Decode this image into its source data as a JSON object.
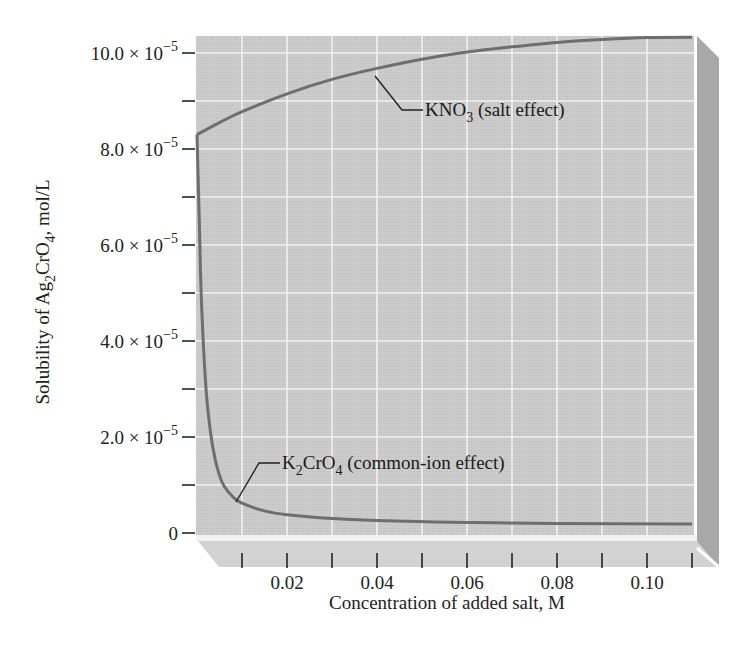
{
  "chart_data": {
    "type": "line",
    "title": "",
    "xlabel": "Concentration of added salt, M",
    "ylabel": "Solubility of Ag2CrO4, mol/L",
    "ylabel_parts": {
      "pre": "Solubility of Ag",
      "sub1": "2",
      "mid": "CrO",
      "sub2": "4",
      "post": ", mol/L"
    },
    "xlim": [
      0,
      0.11
    ],
    "ylim": [
      0,
      0.000105
    ],
    "grid": true,
    "x_ticks": [
      0.01,
      0.02,
      0.03,
      0.04,
      0.05,
      0.06,
      0.07,
      0.08,
      0.09,
      0.1,
      0.11
    ],
    "x_tick_labels": [
      {
        "value": 0.02,
        "label": "0.02"
      },
      {
        "value": 0.04,
        "label": "0.04"
      },
      {
        "value": 0.06,
        "label": "0.06"
      },
      {
        "value": 0.08,
        "label": "0.08"
      },
      {
        "value": 0.1,
        "label": "0.10"
      }
    ],
    "y_ticks": [
      0,
      1e-05,
      2e-05,
      3e-05,
      4e-05,
      5e-05,
      6e-05,
      7e-05,
      8e-05,
      9e-05,
      0.0001
    ],
    "y_tick_labels": [
      {
        "value": 0,
        "mant": "0",
        "exp": ""
      },
      {
        "value": 2e-05,
        "mant": "2.0 × 10",
        "exp": "−5"
      },
      {
        "value": 4e-05,
        "mant": "4.0 × 10",
        "exp": "−5"
      },
      {
        "value": 6e-05,
        "mant": "6.0 × 10",
        "exp": "−5"
      },
      {
        "value": 8e-05,
        "mant": "8.0 × 10",
        "exp": "−5"
      },
      {
        "value": 0.0001,
        "mant": "10.0 × 10",
        "exp": "−5"
      }
    ],
    "series": [
      {
        "name": "KNO3 (salt effect)",
        "x": [
          0,
          0.005,
          0.01,
          0.02,
          0.03,
          0.04,
          0.05,
          0.06,
          0.07,
          0.08,
          0.09,
          0.1,
          0.11
        ],
        "values": [
          8.3e-05,
          8.55e-05,
          8.78e-05,
          9.15e-05,
          9.45e-05,
          9.68e-05,
          9.87e-05,
          0.0001002,
          0.0001013,
          0.0001022,
          0.0001028,
          0.0001032,
          0.0001033
        ]
      },
      {
        "name": "K2CrO4 (common-ion effect)",
        "x": [
          0,
          0.0005,
          0.001,
          0.002,
          0.003,
          0.004,
          0.005,
          0.006,
          0.008,
          0.01,
          0.015,
          0.02,
          0.03,
          0.04,
          0.06,
          0.08,
          0.11
        ],
        "values": [
          8.3e-05,
          6.5e-05,
          4.8e-05,
          3e-05,
          2.1e-05,
          1.55e-05,
          1.2e-05,
          9.8e-06,
          7.5e-06,
          6.2e-06,
          4.6e-06,
          3.8e-06,
          3e-06,
          2.6e-06,
          2.2e-06,
          2e-06,
          1.9e-06
        ]
      }
    ],
    "annotations": [
      {
        "text": "KNO3 (salt effect)",
        "base": "KNO",
        "sub": "3",
        "rest": " (salt effect)",
        "x_anchor": 0.037,
        "y_anchor": 9.6e-05
      },
      {
        "text": "K2CrO4 (common-ion effect)",
        "base": "K",
        "sub": "2",
        "mid": "CrO",
        "sub2": "4",
        "rest": " (common-ion effect)",
        "x_anchor": 0.008,
        "y_anchor": 7.5e-06
      }
    ],
    "colors": {
      "plot_background": "#c8c8c8",
      "grid": "#f2f2f2",
      "curve": "#6e6e6e",
      "side_face": "#a9a9a9",
      "bottom_face": "#d4d4d4"
    }
  }
}
